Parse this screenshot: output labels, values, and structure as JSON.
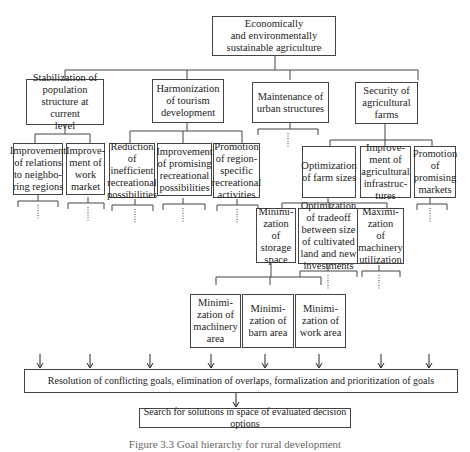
{
  "root": "Economically\nand environmentally\nsustainable agriculture",
  "level1": [
    "Stabilization of\npopulation\nstructure at current\nlevel",
    "Harmonization\nof tourism\ndevelopment",
    "Maintenance of\nurban structures",
    "Security of\nagricultural\nfarms"
  ],
  "level2": [
    "Improvement\nof relations\nto neighbo-\nring regions",
    "Improve-\nment of\nwork\nmarket",
    "Reduction\nof\ninefficient\nrecreational\npossibilities",
    "Improvement\nof promising\nrecreational\npossibilities",
    "Promotion\nof region-\nspecific\nrecreational\nactivities",
    "Optimization\nof farm sizes",
    "Improve-\nment of\nagricultural\ninfrastruc-\ntures",
    "Promotion\nof\npromising\nmarkets"
  ],
  "level3": [
    "Minimi-\nzation\nof\nstorage\nspace",
    "Optimization\nof tradeoff\nbetween size\nof cultivated\nland and new\ninvestments",
    "Maximi-\nzation\nof\nmachinery\nutilization"
  ],
  "level4": [
    "Minimi-\nzation of\nmachinery\narea",
    "Minimi-\nzation of\nbarn area",
    "Minimi-\nzation of\nwork area"
  ],
  "resolution": "Resolution of conflicting goals, elimination of overlaps, formalization and prioritization of goals",
  "search": "Search for solutions in space of evaluated decision options",
  "caption": "Figure 3.3   Goal hierarchy for rural development"
}
